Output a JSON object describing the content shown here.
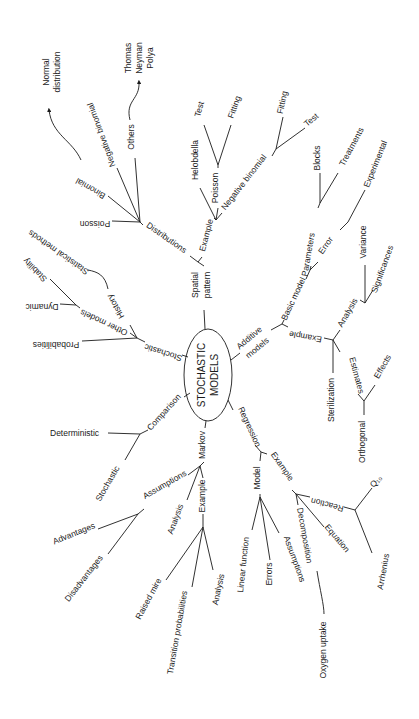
{
  "diagram": {
    "type": "mind-map",
    "orientation": "rotated 90 degrees",
    "center": {
      "line1": "STOCHASTIC",
      "line2": "MODELS"
    },
    "branches": {
      "spatial_pattern": {
        "label_line1": "Spatial",
        "label_line2": "pattern",
        "example": "Example",
        "helobdella": "Helobdella",
        "poisson": "Poisson",
        "poisson_test": "Test",
        "poisson_fitting": "Fitting",
        "negative_binomial": "Negative binomial",
        "nb_fitting": "Fitting",
        "nb_test": "Test",
        "distributions": "Distributions",
        "dist_poisson": "Poisson",
        "dist_binomial": "Binomial",
        "dist_negative_binomial": "Negative binomial",
        "dist_others": "Others",
        "normal_line1": "Normal",
        "normal_line2": "distribution",
        "tnp_line1": "Thomas",
        "tnp_line2": "Neyman",
        "tnp_line3": "Polya"
      },
      "additive_models": {
        "label_line1": "Additive",
        "label_line2": "models",
        "basic_model": "Basic model",
        "parameters": "Parameters",
        "blocks": "Blocks",
        "treatments": "Treatments",
        "error": "Error",
        "experimental": "Experimental",
        "example": "Example",
        "analysis": "Analysis",
        "variance": "Variance",
        "significances": "Significances",
        "estimates": "Estimates",
        "sterilization": "Sterilization",
        "orthogonal": "Orthogonal",
        "effects": "Effects"
      },
      "regression": {
        "label": "Regression",
        "model": "Model",
        "linear_function": "Linear function",
        "errors": "Errors",
        "assumptions": "Assumptions",
        "example": "Example",
        "decomposition": "Decomposition",
        "oxygen_uptake": "Oxygen uptake",
        "equation": "Equation",
        "reaction": "Reaction",
        "q10": "Q₁₀",
        "arrhenius": "Arrhenius"
      },
      "markov": {
        "label": "Markov",
        "assumptions": "Assumptions",
        "advantages": "Advantages",
        "disadvantages": "Disadvantages",
        "example": "Example",
        "analysis": "Analysis",
        "raised_mire": "Raised mire",
        "transition_probabilities": "Transition probabilities",
        "analysis2": "Analysis"
      },
      "comparison": {
        "label": "Comparison",
        "deterministic": "Deterministic",
        "stochastic": "Stochastic"
      },
      "stochastic": {
        "label": "Stochastic",
        "probabilities": "Probabilities",
        "other_models": "Other models",
        "dynamic": "Dynamic",
        "stability": "Stability",
        "history": "History",
        "statistical_methods": "Statistical methods"
      }
    }
  }
}
